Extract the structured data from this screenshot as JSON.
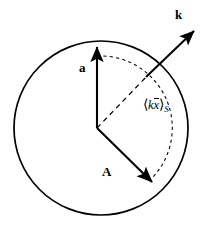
{
  "figure": {
    "type": "vector-diagram",
    "background_color": "#ffffff",
    "stroke_color": "#000000",
    "circle": {
      "name": "unit-sphere-outline",
      "center_x": 101,
      "center_y": 128,
      "radius": 87,
      "stroke_width": 1.6,
      "dashed": false
    },
    "origin": {
      "x": 97,
      "y": 128
    },
    "vectors": [
      {
        "id": "a",
        "label": "a",
        "label_x": 79,
        "label_y": 61,
        "from_x": 97,
        "from_y": 128,
        "to_x": 97,
        "to_y": 43,
        "style": "solid",
        "arrowhead": true
      },
      {
        "id": "A",
        "label": "A",
        "label_x": 102,
        "label_y": 165,
        "from_x": 97,
        "from_y": 128,
        "to_x": 156,
        "to_y": 186,
        "style": "solid",
        "arrowhead": true
      },
      {
        "id": "k",
        "label": "k",
        "label_x": 175,
        "label_y": 8,
        "from_x": 146,
        "from_y": 77,
        "to_x": 198,
        "to_y": 27,
        "style": "solid",
        "arrowhead": true
      }
    ],
    "dashed_elements": [
      {
        "id": "k-inner-ray",
        "kind": "line",
        "from_x": 97,
        "from_y": 128,
        "to_x": 148,
        "to_y": 75,
        "dash_pattern": "5,4"
      },
      {
        "id": "angle-arc",
        "kind": "arc",
        "center_x": 97,
        "center_y": 128,
        "radius": 72,
        "start_angle_deg": 90,
        "end_angle_deg": -43,
        "dash_pattern": "3,3"
      }
    ],
    "annotations": [
      {
        "id": "kxbar-avg",
        "text": "⟨k x̄⟩S",
        "bracket_open": "⟨",
        "bracket_close": "⟩",
        "symbol": "k",
        "symbol_overbar": "x",
        "subscript": "S",
        "x": 143,
        "y": 98
      }
    ]
  }
}
